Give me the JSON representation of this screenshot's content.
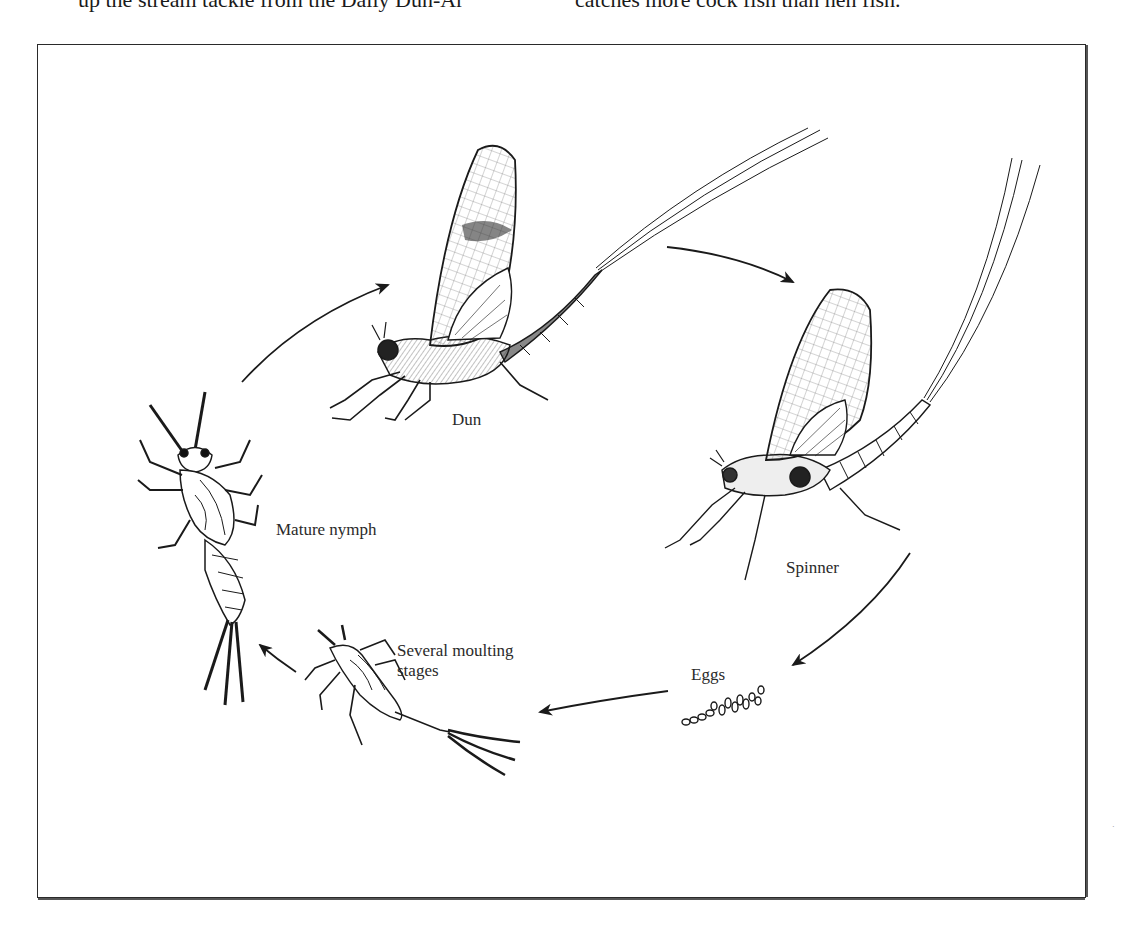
{
  "header_text": {
    "left": "up the stream tackle from the Daily Dun-Ar",
    "right": "catches more cock fish than hen fish."
  },
  "diagram": {
    "stages": [
      {
        "id": "dun",
        "label": "Dun"
      },
      {
        "id": "spinner",
        "label": "Spinner"
      },
      {
        "id": "eggs",
        "label": "Eggs"
      },
      {
        "id": "moulting",
        "label_line1": "Several moulting",
        "label_line2": "stages"
      },
      {
        "id": "nymph",
        "label": "Mature nymph"
      }
    ],
    "arrows": [
      {
        "from": "nymph",
        "to": "dun"
      },
      {
        "from": "dun",
        "to": "spinner"
      },
      {
        "from": "spinner",
        "to": "eggs"
      },
      {
        "from": "eggs",
        "to": "moulting"
      },
      {
        "from": "moulting",
        "to": "nymph"
      }
    ],
    "line_color": "#1a1a1a",
    "frame_color": "#2a2a2a"
  }
}
